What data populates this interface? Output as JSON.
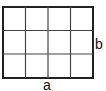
{
  "diagram": {
    "type": "grid-rectangle",
    "columns": 4,
    "rows": 3,
    "labels": {
      "bottom": "a",
      "right": "b"
    },
    "colors": {
      "outer_border": "#222222",
      "inner_lines": "#444444",
      "label": "#111111"
    }
  }
}
